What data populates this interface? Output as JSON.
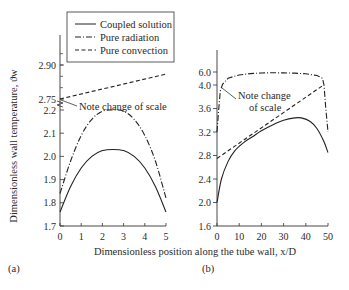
{
  "chart_data": [
    {
      "panel": "(a)",
      "type": "line",
      "xlabel": "Dimensionless position along the tube wall, x/D",
      "ylabel": "Dimensionless wall temperature, ϑw",
      "xlim": [
        0,
        5
      ],
      "x_ticks": [
        "0",
        "1",
        "2",
        "3",
        "4",
        "5"
      ],
      "ylim_lower": [
        1.7,
        2.2
      ],
      "y_ticks_lower": [
        "1.7",
        "1.8",
        "1.9",
        "2.0",
        "2.1",
        "2.2"
      ],
      "ylim_upper": [
        2.75,
        2.9
      ],
      "y_ticks_upper": [
        "2.75",
        "2.90"
      ],
      "annotation": "Note change of scale",
      "series": [
        {
          "name": "Coupled solution",
          "style": "solid",
          "scale": "lower",
          "x": [
            0,
            0.5,
            1,
            1.5,
            2,
            2.5,
            3,
            3.5,
            4,
            4.5,
            5
          ],
          "y": [
            1.76,
            1.87,
            1.95,
            2.0,
            2.025,
            2.03,
            2.025,
            2.0,
            1.95,
            1.87,
            1.76
          ]
        },
        {
          "name": "Pure radiation",
          "style": "dashdot",
          "scale": "lower",
          "x": [
            0,
            0.5,
            1,
            1.5,
            2,
            2.5,
            3,
            3.5,
            4,
            4.5,
            5
          ],
          "y": [
            1.84,
            1.98,
            2.09,
            2.16,
            2.195,
            2.2,
            2.195,
            2.16,
            2.09,
            1.98,
            1.82
          ]
        },
        {
          "name": "Pure convection",
          "style": "dashed",
          "scale": "upper",
          "x": [
            0,
            5
          ],
          "y": [
            2.75,
            2.86
          ]
        }
      ]
    },
    {
      "panel": "(b)",
      "type": "line",
      "xlim": [
        0,
        50
      ],
      "x_ticks": [
        "0",
        "10",
        "20",
        "30",
        "40",
        "50"
      ],
      "ylim_lower": [
        1.6,
        4.0
      ],
      "y_ticks_lower": [
        "1.6",
        "2.0",
        "2.4",
        "2.8",
        "3.2",
        "3.6",
        "4.0"
      ],
      "ylim_upper": [
        4.0,
        6.0
      ],
      "y_ticks_upper": [
        "6.0"
      ],
      "annotation": "Note change\nof scale",
      "series": [
        {
          "name": "Coupled solution",
          "style": "solid",
          "x": [
            0,
            2,
            5,
            8,
            12,
            16,
            20,
            25,
            30,
            35,
            38,
            42,
            45,
            48,
            50
          ],
          "y": [
            2.0,
            2.4,
            2.7,
            2.88,
            3.02,
            3.12,
            3.22,
            3.32,
            3.4,
            3.44,
            3.44,
            3.38,
            3.26,
            3.05,
            2.85
          ]
        },
        {
          "name": "Pure radiation",
          "style": "dashdot",
          "x": [
            0,
            0.8,
            1.5,
            2.5,
            5,
            10,
            15,
            20,
            25,
            30,
            35,
            40,
            45,
            47.5,
            48.2,
            49,
            50
          ],
          "y": [
            3.2,
            3.6,
            3.9,
            4.1,
            5.05,
            5.55,
            5.75,
            5.85,
            5.88,
            5.86,
            5.82,
            5.72,
            5.45,
            5.05,
            4.0,
            3.6,
            3.2
          ]
        },
        {
          "name": "Pure convection",
          "style": "dashed",
          "x": [
            0,
            48
          ],
          "y": [
            2.75,
            4.0
          ]
        }
      ]
    }
  ],
  "legend": [
    "Coupled solution",
    "Pure radiation",
    "Pure convection"
  ],
  "panel_labels": [
    "(a)",
    "(b)"
  ]
}
